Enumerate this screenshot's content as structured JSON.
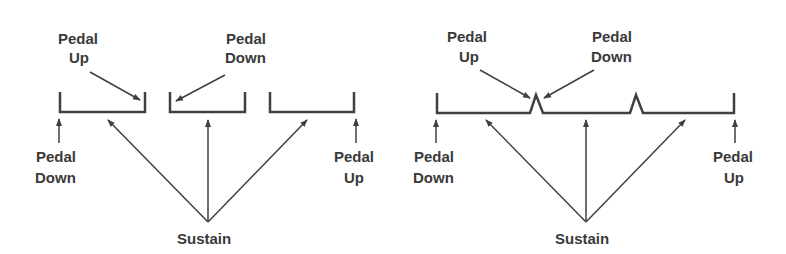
{
  "left_diagram": {
    "top_left_label": [
      "Pedal",
      "Up"
    ],
    "top_right_label": [
      "Pedal",
      "Down"
    ],
    "bottom_left_label": [
      "Pedal",
      "Down"
    ],
    "bottom_right_label": [
      "Pedal",
      "Up"
    ],
    "bottom_center_label": "Sustain"
  },
  "right_diagram": {
    "top_left_label": [
      "Pedal",
      "Up"
    ],
    "top_right_label": [
      "Pedal",
      "Down"
    ],
    "bottom_left_label": [
      "Pedal",
      "Down"
    ],
    "bottom_right_label": [
      "Pedal",
      "Up"
    ],
    "bottom_center_label": "Sustain"
  },
  "colors": {
    "line": "#404040",
    "text": "#3a3a3a",
    "background": "#ffffff"
  }
}
